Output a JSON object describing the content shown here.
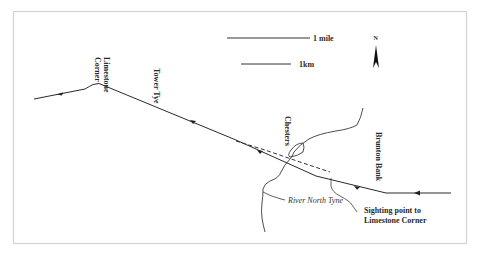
{
  "map": {
    "scale_bars": [
      {
        "label": "1 mile"
      },
      {
        "label": "1km"
      }
    ],
    "north_arrow": {
      "label": "N"
    },
    "labels": {
      "limestone_corner_line1": "Limestone",
      "limestone_corner_line2": "Corner",
      "tower_tye": "Tower Tye",
      "chesters": "Chesters",
      "brunton_bank": "Brunton Bank",
      "river": "River North Tyne",
      "sighting_line1": "Sighting point to",
      "sighting_line2": "Limestone Corner"
    },
    "colors": {
      "line": "#2a2a2a",
      "frame": "#d4d4d4",
      "background": "#ffffff"
    }
  }
}
